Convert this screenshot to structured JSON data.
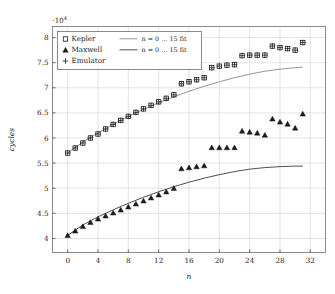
{
  "chart_data": {
    "type": "scatter",
    "title": "",
    "xlabel": "n",
    "ylabel": "cycles",
    "y_multiplier": "·10",
    "y_multiplier_exp": "4",
    "xlim": [
      -2,
      34
    ],
    "ylim": [
      3.72,
      8.22
    ],
    "xticks": [
      0,
      4,
      8,
      12,
      16,
      20,
      24,
      28,
      32
    ],
    "yticks": [
      4,
      4.5,
      5,
      5.5,
      6,
      6.5,
      7,
      7.5,
      8
    ],
    "ytick_labels": [
      "4",
      "4.5",
      "5",
      "5.5",
      "6",
      "6.5",
      "7",
      "7.5",
      "8"
    ],
    "xtick_labels": [
      "0",
      "4",
      "8",
      "12",
      "16",
      "20",
      "24",
      "28",
      "32"
    ],
    "grid": true,
    "legend_position": "top-left",
    "series": [
      {
        "name": "Kepler",
        "marker": "square",
        "color": "#1a1a1a",
        "x": [
          0,
          1,
          2,
          3,
          4,
          5,
          6,
          7,
          8,
          9,
          10,
          11,
          12,
          13,
          14,
          15,
          16,
          17,
          18,
          19,
          20,
          21,
          22,
          23,
          24,
          25,
          26,
          27,
          28,
          29,
          30,
          31
        ],
        "y": [
          5.7,
          5.8,
          5.9,
          6.0,
          6.08,
          6.18,
          6.27,
          6.35,
          6.43,
          6.51,
          6.58,
          6.65,
          6.72,
          6.79,
          6.86,
          7.08,
          7.12,
          7.16,
          7.2,
          7.4,
          7.43,
          7.45,
          7.46,
          7.64,
          7.65,
          7.65,
          7.65,
          7.83,
          7.8,
          7.78,
          7.75,
          7.9
        ]
      },
      {
        "name": "Maxwell",
        "marker": "triangle",
        "color": "#1a1a1a",
        "x": [
          0,
          1,
          2,
          3,
          4,
          5,
          6,
          7,
          8,
          9,
          10,
          11,
          12,
          13,
          14,
          15,
          16,
          17,
          18,
          19,
          20,
          21,
          22,
          23,
          24,
          25,
          26,
          27,
          28,
          29,
          30,
          31
        ],
        "y": [
          4.06,
          4.15,
          4.24,
          4.32,
          4.39,
          4.45,
          4.51,
          4.57,
          4.63,
          4.69,
          4.75,
          4.81,
          4.87,
          4.93,
          5.0,
          5.39,
          5.41,
          5.43,
          5.45,
          5.81,
          5.81,
          5.81,
          5.81,
          6.14,
          6.12,
          6.1,
          6.06,
          6.38,
          6.32,
          6.28,
          6.2,
          6.48
        ]
      },
      {
        "name": "Emulator",
        "marker": "plus",
        "color": "#1a1a1a",
        "x": [
          0,
          1,
          2,
          3,
          4,
          5,
          6,
          7,
          8,
          9,
          10,
          11,
          12,
          13,
          14,
          15,
          16,
          17,
          18,
          19,
          20,
          21,
          22,
          23,
          24,
          25,
          26,
          27,
          28,
          29,
          30,
          31
        ],
        "y": [
          5.7,
          5.8,
          5.9,
          6.0,
          6.08,
          6.18,
          6.27,
          6.35,
          6.43,
          6.51,
          6.58,
          6.65,
          6.72,
          6.79,
          6.86,
          7.08,
          7.12,
          7.16,
          7.2,
          7.4,
          7.43,
          7.45,
          7.46,
          7.64,
          7.65,
          7.65,
          7.65,
          7.83,
          7.8,
          7.78,
          7.75,
          7.9
        ]
      }
    ],
    "fits": [
      {
        "name": "n = 0 … 15 fit",
        "for_series": "Kepler",
        "color": "#8a8a8a",
        "x": [
          0,
          2,
          4,
          6,
          8,
          10,
          12,
          14,
          16,
          18,
          20,
          22,
          24,
          26,
          28,
          30,
          31
        ],
        "y": [
          5.7,
          5.92,
          6.1,
          6.27,
          6.43,
          6.57,
          6.7,
          6.82,
          6.93,
          7.03,
          7.12,
          7.2,
          7.27,
          7.33,
          7.37,
          7.4,
          7.41
        ]
      },
      {
        "name": "n = 0 … 15 fit",
        "for_series": "Maxwell",
        "color": "#3a3a3a",
        "x": [
          0,
          2,
          4,
          6,
          8,
          10,
          12,
          14,
          16,
          18,
          20,
          22,
          24,
          26,
          28,
          30,
          31
        ],
        "y": [
          4.06,
          4.27,
          4.43,
          4.57,
          4.7,
          4.82,
          4.93,
          5.03,
          5.12,
          5.2,
          5.27,
          5.33,
          5.38,
          5.41,
          5.43,
          5.44,
          5.44
        ]
      }
    ],
    "legend": {
      "entries": [
        {
          "label": "Kepler",
          "marker": "square",
          "fit_label": "n = 0 … 15 fit",
          "fit_color": "#8a8a8a"
        },
        {
          "label": "Maxwell",
          "marker": "triangle",
          "fit_label": "n = 0 … 15 fit",
          "fit_color": "#3a3a3a"
        },
        {
          "label": "Emulator",
          "marker": "plus",
          "fit_label": "",
          "fit_color": ""
        }
      ]
    }
  }
}
